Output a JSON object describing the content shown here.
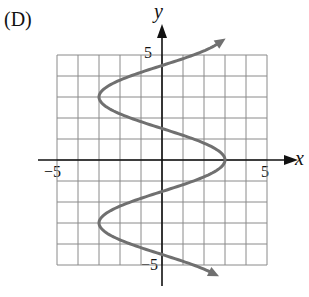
{
  "figure": {
    "panel_label": "(D)",
    "x_axis_label": "x",
    "y_axis_label": "y",
    "tick_labels": {
      "x_neg": "−5",
      "x_pos": "5",
      "y_pos": "5",
      "y_neg": "−5"
    }
  },
  "chart_data": {
    "type": "line",
    "title": "(D)",
    "xlabel": "x",
    "ylabel": "y",
    "xlim": [
      -5,
      5
    ],
    "ylim": [
      -5,
      5
    ],
    "grid": true,
    "grid_step": 1,
    "tick_labels": {
      "x": [
        "-5",
        "5"
      ],
      "y": [
        "5",
        "-5"
      ]
    },
    "curve_description": "sinusoidal curve opening horizontally, x = 3cos(pi*y/3), arrows at both ends",
    "series": [
      {
        "name": "curve",
        "color": "#707070",
        "points": [
          {
            "x": 1.6,
            "y": -5.4
          },
          {
            "x": 0,
            "y": -4.5
          },
          {
            "x": -1.5,
            "y": -4
          },
          {
            "x": -3,
            "y": -3
          },
          {
            "x": -1.5,
            "y": -2
          },
          {
            "x": 0,
            "y": -1.5
          },
          {
            "x": 1.5,
            "y": -1
          },
          {
            "x": 3,
            "y": 0
          },
          {
            "x": 1.5,
            "y": 1
          },
          {
            "x": 0,
            "y": 1.5
          },
          {
            "x": -1.5,
            "y": 2
          },
          {
            "x": -3,
            "y": 3
          },
          {
            "x": -1.5,
            "y": 4
          },
          {
            "x": 0,
            "y": 4.5
          },
          {
            "x": 2.3,
            "y": 5.7
          }
        ]
      }
    ]
  }
}
